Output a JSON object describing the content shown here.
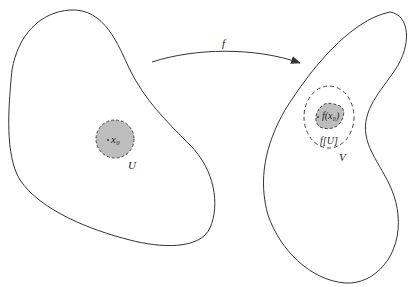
{
  "diagram": {
    "type": "continuity neighborhood mapping",
    "map_label": "f",
    "left_region": {
      "point_label": "x₀",
      "neighborhood_label": "U"
    },
    "right_region": {
      "point_label": "f(x₀)",
      "image_label": "f[U]",
      "neighborhood_label": "V"
    },
    "colors": {
      "stroke": "#333333",
      "fill": "#bdbdbd",
      "background": "#ffffff"
    }
  }
}
